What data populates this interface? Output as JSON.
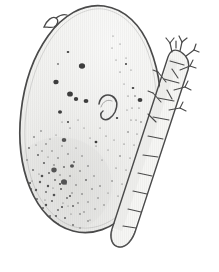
{
  "figure": {
    "kind": "scientific-line-drawing",
    "medium": "scanned pen-and-ink stipple illustration",
    "background_color": "#ffffff",
    "ink_color": "#4a4a4a",
    "dark_ink_color": "#3b3b3b",
    "stipple_color": "#555555",
    "interior_fill": "#f2f2f0",
    "interior_shade": "#e6e6e3",
    "width_px": 219,
    "height_px": 272,
    "subject_count": 2,
    "alt_text": "Line drawing of an oval stippled body with dark spots beside an elongate segmented larva bearing bristle tufts"
  },
  "subjects": [
    {
      "id": "oval-body",
      "name": "oval stippled body",
      "description": "Large ovoid outline tilted slightly, pale gray interior, dense stippling concentrated toward the lower left, scattered dark blotches in the upper left, a small comma-shaped hook mark near the center, and a tiny pointed spur projecting from the upper left margin",
      "center_x": 80,
      "center_y": 122,
      "width_px": 122,
      "height_px": 218,
      "rotation_deg": -8,
      "outline_stroke_width": 1.6,
      "features": [
        {
          "name": "apical-spur",
          "x": 50,
          "y": 22
        },
        {
          "name": "comma-hook-mark",
          "x": 105,
          "y": 107
        },
        {
          "name": "dark-blotch-field",
          "x": 62,
          "y": 80
        },
        {
          "name": "dense-stipple-field",
          "x": 60,
          "y": 175
        }
      ]
    },
    {
      "id": "segmented-larva",
      "name": "segmented larva",
      "description": "Elongate worm-like larva oriented from upper right to lower left, divided into eleven trapezoidal segments by transverse lines, bearing small Y-shaped bristle tufts along the right margin and branched appendages at the head, tapering to a rounded terminal segment",
      "head_x": 186,
      "head_y": 46,
      "tail_x": 120,
      "tail_y": 246,
      "segment_count": 11,
      "rotation_deg": 18,
      "outline_stroke_width": 1.3,
      "features": [
        {
          "name": "head-appendages",
          "x": 186,
          "y": 46
        },
        {
          "name": "bristle-tufts",
          "x": 170,
          "y": 95
        },
        {
          "name": "terminal-segment",
          "x": 122,
          "y": 240
        }
      ]
    }
  ],
  "labels": {
    "visible_text": [],
    "note": "No caption, scale bar, axis, or annotation text is present in the image."
  }
}
